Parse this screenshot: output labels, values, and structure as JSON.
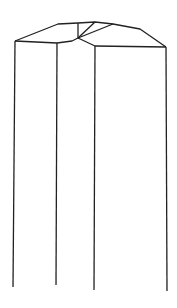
{
  "figure": {
    "type": "line-drawing",
    "stroke_color": "#222222",
    "background": "#ffffff",
    "outline_top": [
      [
        15,
        41
      ],
      [
        58,
        24
      ],
      [
        78,
        23
      ],
      [
        95,
        22
      ],
      [
        113,
        24
      ],
      [
        140,
        29
      ],
      [
        166,
        47
      ]
    ],
    "inner_edge": [
      [
        15,
        41
      ],
      [
        57,
        43
      ],
      [
        72,
        41
      ],
      [
        78,
        38
      ],
      [
        95,
        46
      ],
      [
        166,
        47
      ]
    ],
    "facet_lines": [
      [
        [
          78,
          23
        ],
        [
          78,
          38
        ]
      ],
      [
        [
          78,
          38
        ],
        [
          95,
          22
        ]
      ],
      [
        [
          78,
          38
        ],
        [
          113,
          24
        ]
      ]
    ],
    "verticals": [
      [
        [
          15,
          41
        ],
        [
          13,
          287
        ]
      ],
      [
        [
          57,
          43
        ],
        [
          56,
          285
        ]
      ],
      [
        [
          95,
          46
        ],
        [
          94,
          290
        ]
      ],
      [
        [
          166,
          47
        ],
        [
          167,
          291
        ]
      ]
    ]
  }
}
